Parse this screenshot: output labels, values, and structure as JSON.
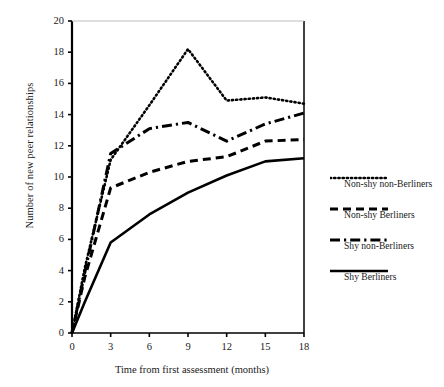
{
  "chart_data": {
    "type": "line",
    "title": "",
    "xlabel": "Time from first assessment (months)",
    "ylabel": "Number of new peer relationships",
    "xlim": [
      0,
      18
    ],
    "ylim": [
      0,
      20
    ],
    "xticks": [
      "0",
      "3",
      "6",
      "9",
      "12",
      "15",
      "18"
    ],
    "yticks": [
      "0",
      "2",
      "4",
      "6",
      "8",
      "10",
      "12",
      "14",
      "16",
      "18",
      "20"
    ],
    "grid": false,
    "legend_position": "right",
    "x": [
      0,
      1,
      3,
      6,
      9,
      12,
      15,
      18
    ],
    "series": [
      {
        "name": "Non-shy non-Berliners",
        "style": "dotted",
        "values": [
          0,
          4.2,
          11.1,
          14.6,
          18.2,
          14.9,
          15.1,
          14.7
        ]
      },
      {
        "name": "Non-shy Berliners",
        "style": "dashed",
        "values": [
          0,
          3.6,
          9.3,
          10.3,
          11.0,
          11.3,
          12.3,
          12.4
        ]
      },
      {
        "name": "Shy non-Berliners",
        "style": "dash-dot",
        "values": [
          0,
          3.9,
          11.5,
          13.1,
          13.5,
          12.3,
          13.4,
          14.1
        ]
      },
      {
        "name": "Shy Berliners",
        "style": "solid",
        "values": [
          0,
          2.0,
          5.8,
          7.6,
          9.0,
          10.1,
          11.0,
          11.2
        ]
      }
    ]
  },
  "axes": {
    "y_label": "Number of new peer relationships",
    "x_label": "Time from first assessment (months)",
    "y_ticks": [
      "20",
      "18",
      "16",
      "14",
      "12",
      "10",
      "8",
      "6",
      "4",
      "2",
      "0"
    ],
    "x_ticks": [
      "0",
      "3",
      "6",
      "9",
      "12",
      "15",
      "18"
    ]
  },
  "legend": {
    "items": [
      {
        "label": "Non-shy non-Berliners",
        "style": "dotted"
      },
      {
        "label": "Non-shy Berliners",
        "style": "dashed"
      },
      {
        "label": "Shy non-Berliners",
        "style": "dash-dot"
      },
      {
        "label": "Shy Berliners",
        "style": "solid"
      }
    ]
  },
  "colors": {
    "ink": "#000000",
    "text": "#1a1a1a"
  }
}
